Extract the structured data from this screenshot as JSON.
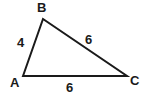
{
  "diagram": {
    "type": "triangle",
    "shape_name": "triangle-ABC",
    "background_color": "#ffffff",
    "stroke_color": "#1a1a1a",
    "stroke_width": 2,
    "vertices": [
      {
        "name": "A",
        "label": "A",
        "x": 23,
        "y": 76
      },
      {
        "name": "B",
        "label": "B",
        "x": 43,
        "y": 19
      },
      {
        "name": "C",
        "label": "C",
        "x": 127,
        "y": 76
      }
    ],
    "sides": [
      {
        "name": "AB",
        "from": "A",
        "to": "B",
        "length_label": "4"
      },
      {
        "name": "BC",
        "from": "B",
        "to": "C",
        "length_label": "6"
      },
      {
        "name": "AC",
        "from": "A",
        "to": "C",
        "length_label": "6"
      }
    ],
    "labels": {
      "vertex_A": "A",
      "vertex_B": "B",
      "vertex_C": "C",
      "side_AB": "4",
      "side_BC": "6",
      "side_AC": "6"
    },
    "polygon_points": "23,76 43,19 127,76"
  }
}
